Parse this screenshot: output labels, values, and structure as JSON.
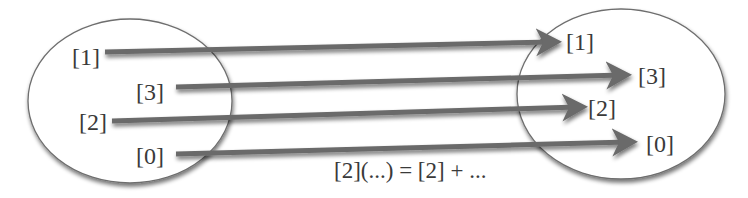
{
  "diagram": {
    "left_set": {
      "labels": [
        "[1]",
        "[3]",
        "[2]",
        "[0]"
      ]
    },
    "right_set": {
      "labels": [
        "[1]",
        "[3]",
        "[2]",
        "[0]"
      ]
    },
    "mappings": [
      {
        "from": "[1]",
        "to": "[1]"
      },
      {
        "from": "[3]",
        "to": "[3]"
      },
      {
        "from": "[2]",
        "to": "[2]"
      },
      {
        "from": "[0]",
        "to": "[0]"
      }
    ],
    "formula": "[2](...) = [2] + ...",
    "colors": {
      "ellipse_stroke": "#6e6e6e",
      "arrow": "#6a6a6a",
      "text": "#3a3a3a",
      "background": "#ffffff"
    }
  }
}
